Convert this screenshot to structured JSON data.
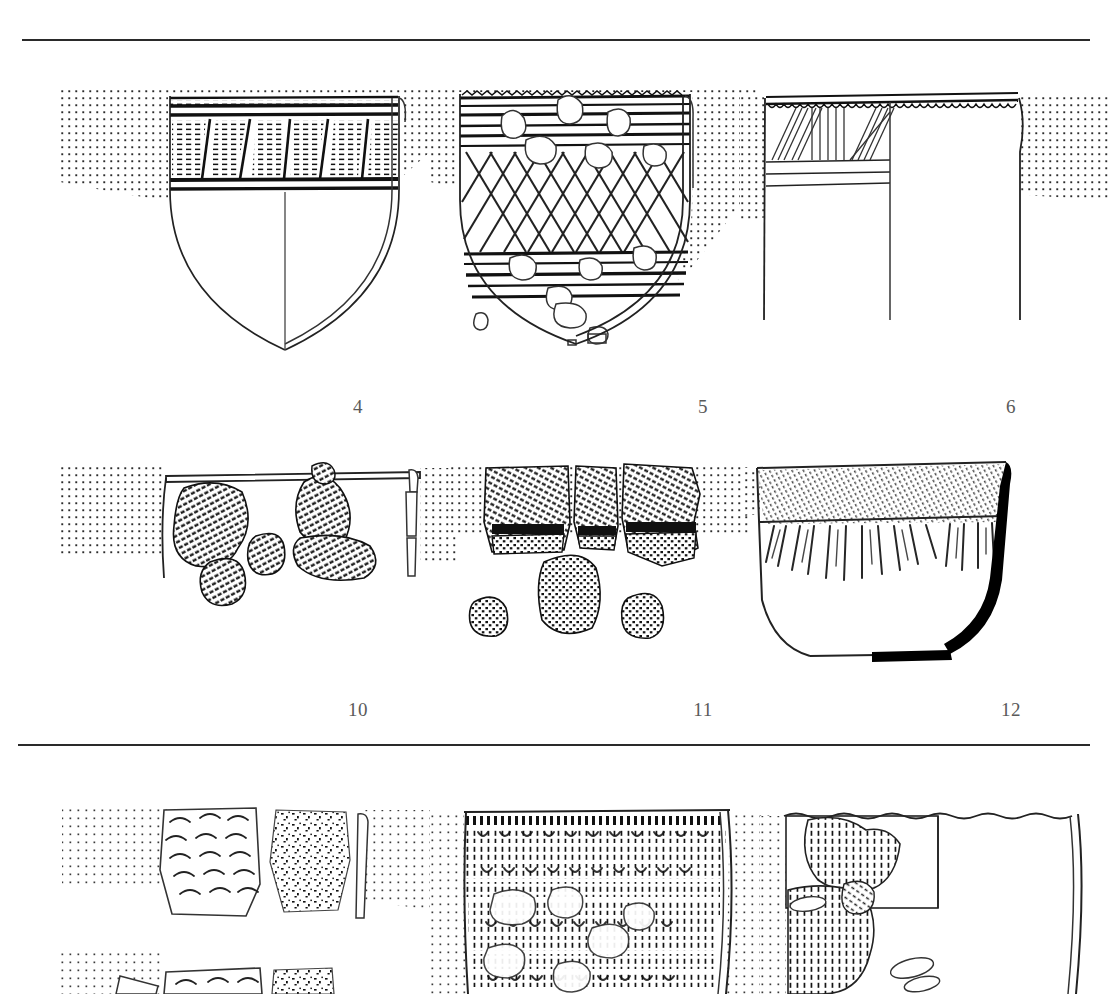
{
  "plate": {
    "kind": "archaeological-pottery-illustration-plate",
    "background_color": "#ffffff",
    "ink_color": "#1a1a1a",
    "rule_color": "#2a2a2a",
    "label_color": "#5a5a5a",
    "rules": [
      {
        "name": "top-rule",
        "y": 39
      },
      {
        "name": "middle-rule",
        "y": 744
      }
    ]
  },
  "rows": [
    {
      "name": "row-upper",
      "items": [
        {
          "label": "4",
          "label_x": 338,
          "form": "round-bottomed deep bowl",
          "rim": "everted plain rim with horizontal banding",
          "decoration": "banded zone of alternating hatched triangles and vertical panels between thick horizontal lines",
          "section_side": "right",
          "stipple_background": true
        },
        {
          "label": "5",
          "label_x": 683,
          "form": "round-bottomed deep bowl",
          "rim": "notched rim with horizontal grooved bands",
          "decoration": "lattice / diamond net field between horizontal incised bands, surface heavily eroded",
          "section_side": "right",
          "stipple_background": true
        },
        {
          "label": "6",
          "label_x": 991,
          "form": "straight-sided cylindrical jar",
          "rim": "scalloped / crenellated rim",
          "decoration": "panel of fine diagonal and vertical incised lines above three horizontal bands",
          "section_side": "left",
          "stipple_background": true
        }
      ]
    },
    {
      "name": "row-lower",
      "items": [
        {
          "label": "10",
          "label_x": 338,
          "form": "reconstructed rim profile with attached sherds",
          "rim": "plain flat rim",
          "decoration": "cord-impressed sherds with dense wavy roulette texture",
          "section_side": "right",
          "stipple_background": true
        },
        {
          "label": "11",
          "label_x": 683,
          "form": "group of loose body sherds",
          "rim": "none",
          "decoration": "diagonal cord-impressed bands above mat-impressed / basketry texture",
          "section_side": "none",
          "stipple_background": true
        },
        {
          "label": "12",
          "label_x": 991,
          "form": "flat-bottomed conical bowl",
          "rim": "plain rounded rim with horizontal girth line",
          "decoration": "radiating fine hatched strokes below the rim band",
          "section_side": "right",
          "stipple_background": true
        }
      ]
    },
    {
      "name": "row-bottom-cropped",
      "items": [
        {
          "label": "",
          "form": "rim sherd with crescent impressions",
          "rim": "plain rim",
          "decoration": "rows of crescent / fingernail impressions beside a speckled rough-textured zone",
          "section_side": "right",
          "stipple_background": true
        },
        {
          "label": "",
          "form": "large vessel body",
          "rim": "plain rim",
          "decoration": "dense horizontal rows of comb-stamped crescent and stroke impressions",
          "section_side": "right",
          "stipple_background": true
        },
        {
          "label": "",
          "form": "flaring vessel with inset detail panel",
          "rim": "wavy rim",
          "decoration": "fine vertical dash impressions with rectangular enlarged-detail inset",
          "section_side": "right",
          "stipple_background": true
        }
      ]
    }
  ]
}
